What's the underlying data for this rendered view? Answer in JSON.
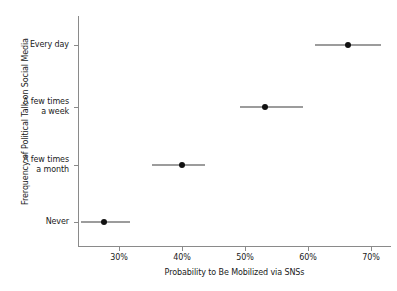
{
  "chart_data": {
    "type": "scatter",
    "title": "",
    "xlabel": "Probability to Be Mobilized via SNSs",
    "ylabel": "Frerquency of Political Talk on Social Media",
    "orientation": "horizontal",
    "grid": false,
    "legend": null,
    "xlim": [
      23.5,
      73.0
    ],
    "xticks": [
      30,
      40,
      50,
      60,
      70
    ],
    "xticklabels": [
      "30%",
      "40%",
      "50%",
      "60%",
      "70%"
    ],
    "categories": [
      "Every day",
      "A few times\na week",
      "A few times\na month",
      "Never"
    ],
    "values": [
      66.3,
      53.2,
      40.0,
      27.7
    ],
    "ci_low": [
      61.1,
      49.2,
      35.3,
      24.0
    ],
    "ci_high": [
      71.6,
      59.2,
      43.7,
      31.7
    ],
    "points": [
      {
        "category": "Every day",
        "value": 66.3,
        "ci_low": 61.1,
        "ci_high": 71.6
      },
      {
        "category": "A few times\na week",
        "value": 53.2,
        "ci_low": 49.2,
        "ci_high": 59.2
      },
      {
        "category": "A few times\na month",
        "value": 40.0,
        "ci_low": 35.3,
        "ci_high": 43.7
      },
      {
        "category": "Never",
        "value": 27.7,
        "ci_low": 24.0,
        "ci_high": 31.7
      }
    ],
    "marker_color": "#111111",
    "errorbar_color": "#3b3b3b",
    "axis_color": "#8a8a8a",
    "background_color": "#ffffff"
  }
}
